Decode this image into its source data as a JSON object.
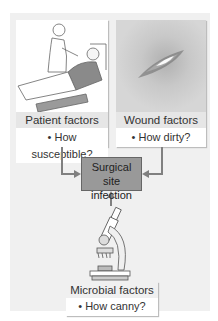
{
  "diagram": {
    "type": "flow",
    "center": {
      "line1": "Surgical site",
      "line2": "infection"
    },
    "factors": [
      {
        "id": "patient",
        "label": "Patient factors",
        "bullet": "• How susceptible?",
        "illustration": "dentist-patient-chair"
      },
      {
        "id": "wound",
        "label": "Wound factors",
        "bullet": "• How dirty?",
        "illustration": "wound-closeup"
      },
      {
        "id": "microbial",
        "label": "Microbial factors",
        "bullet": "• How canny?",
        "illustration": "microscope"
      }
    ],
    "colors": {
      "panel": "#f0f0f0",
      "label_band": "#e6e6e6",
      "center_box": "#999999",
      "arrows": "#808080"
    }
  }
}
